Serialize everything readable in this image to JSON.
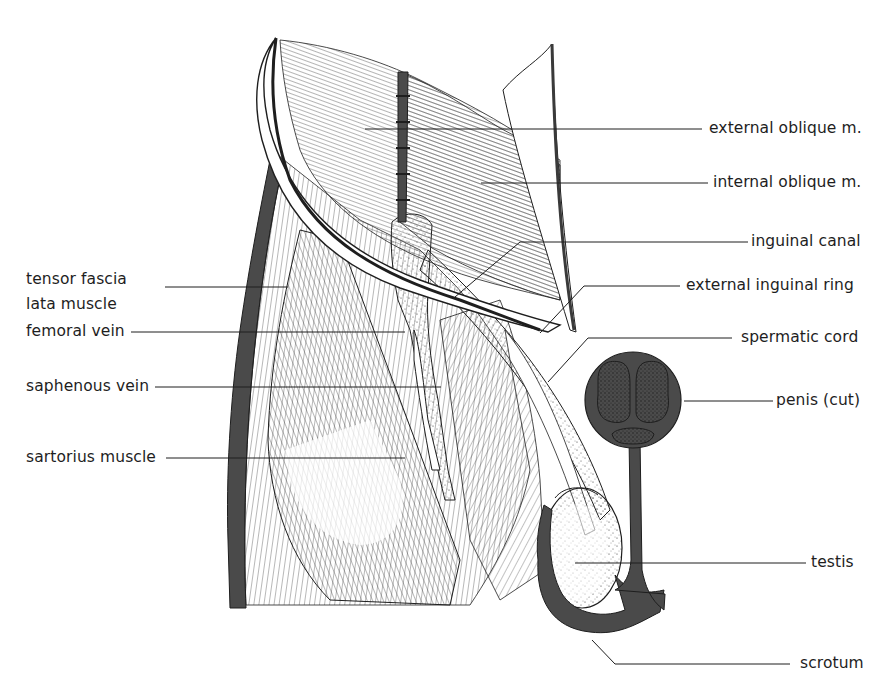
{
  "diagram": {
    "colors": {
      "ink": "#1e1e1e",
      "dark_fill": "#4a4a4a",
      "erectile_fill": "#3a3a3a",
      "background": "#ffffff"
    },
    "labels": {
      "tensor_fascia_line1": "tensor fascia",
      "tensor_fascia_line2": "lata muscle",
      "femoral_vein": "femoral vein",
      "saphenous_vein": "saphenous vein",
      "sartorius_muscle": "sartorius muscle",
      "external_oblique": "external oblique m.",
      "internal_oblique": "internal oblique m.",
      "inguinal_canal": "inguinal canal",
      "external_inguinal_ring": "external inguinal ring",
      "spermatic_cord": "spermatic cord",
      "penis_cut": "penis (cut)",
      "testis": "testis",
      "scrotum": "scrotum"
    }
  }
}
